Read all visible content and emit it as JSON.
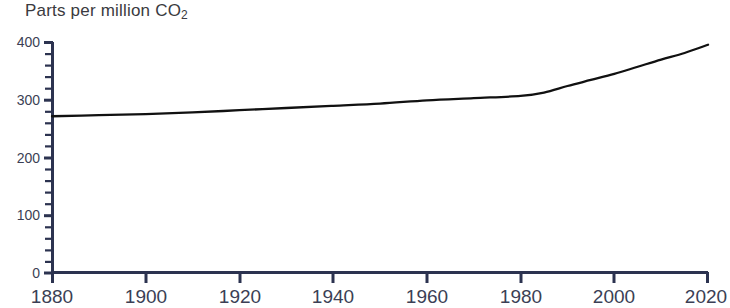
{
  "chart_data": {
    "type": "line",
    "title": "Parts per million CO",
    "title_subscript": "2",
    "xlabel": "",
    "ylabel": "",
    "xlim": [
      1880,
      2020
    ],
    "ylim": [
      0,
      420
    ],
    "grid": false,
    "legend": null,
    "x_ticks": [
      1880,
      1900,
      1920,
      1940,
      1960,
      1980,
      2000,
      2020
    ],
    "x_tick_labels": [
      "1880",
      "1900",
      "1920",
      "1940",
      "1960",
      "1980",
      "2000",
      "2020"
    ],
    "y_ticks": [
      0,
      100,
      200,
      300,
      400
    ],
    "y_tick_labels": [
      "0",
      "100",
      "200",
      "300",
      "400"
    ],
    "y_minor_tick_step": 20,
    "line_color": "#111111",
    "axis_color": "#2c3350",
    "series": [
      {
        "name": "Atmospheric CO2 concentration",
        "x": [
          1880,
          1890,
          1900,
          1910,
          1920,
          1930,
          1940,
          1950,
          1960,
          1970,
          1980,
          1985,
          1990,
          1995,
          2000,
          2005,
          2010,
          2015,
          2020
        ],
        "values": [
          285,
          287,
          289,
          292,
          296,
          300,
          304,
          308,
          314,
          318,
          322,
          328,
          340,
          351,
          362,
          375,
          388,
          400,
          415
        ]
      }
    ]
  },
  "axes_geometry": {
    "plot_left_px": 52,
    "plot_right_px": 708,
    "plot_top_px": 42,
    "plot_bottom_px": 273
  }
}
